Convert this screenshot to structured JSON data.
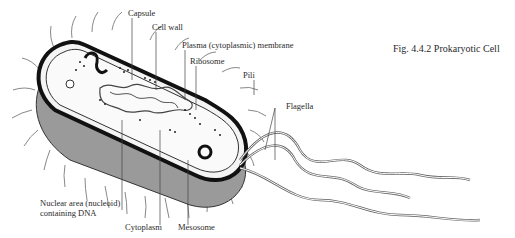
{
  "figure": {
    "caption": "Fig. 4.4.2 Prokaryotic Cell"
  },
  "labels": {
    "capsule": "Capsule",
    "cell_wall": "Cell wall",
    "plasma_membrane": "Plasma (cytoplasmic) membrane",
    "ribosome": "Ribosome",
    "pili": "Pili",
    "flagella": "Flagella",
    "nucleoid_line1": "Nuclear area (nucleoid)",
    "nucleoid_line2": "containing DNA",
    "cytoplasm": "Cytoplasm",
    "mesosome": "Mesosome"
  }
}
